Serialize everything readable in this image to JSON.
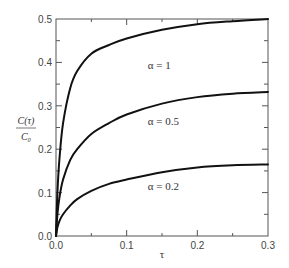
{
  "chart_data": {
    "type": "line",
    "title": "",
    "xlabel": "τ",
    "ylabel_numerator": "C(τ)",
    "ylabel_denominator": "C₀",
    "xlim": [
      0,
      0.3
    ],
    "ylim": [
      0,
      0.5
    ],
    "grid": false,
    "legend": "none",
    "x_ticks": [
      0.0,
      0.1,
      0.2,
      0.3
    ],
    "x_tick_labels": [
      "0.0",
      "0.1",
      "0.2",
      "0.3"
    ],
    "x_minor_ticks": [
      0.05,
      0.15,
      0.25
    ],
    "y_ticks": [
      0.0,
      0.1,
      0.2,
      0.3,
      0.4,
      0.5
    ],
    "y_tick_labels": [
      "0.0",
      "0.1",
      "0.2",
      "0.3",
      "0.4",
      "0.5"
    ],
    "y_minor_ticks": [
      0.05,
      0.15,
      0.25,
      0.35,
      0.45
    ],
    "series": [
      {
        "name": "α = 1",
        "annotation": {
          "text": "α = 1",
          "x": 0.13,
          "y": 0.385
        },
        "x": [
          0,
          0.002,
          0.005,
          0.01,
          0.02,
          0.03,
          0.05,
          0.075,
          0.1,
          0.15,
          0.2,
          0.25,
          0.3
        ],
        "y": [
          0,
          0.1,
          0.18,
          0.26,
          0.34,
          0.38,
          0.42,
          0.44,
          0.455,
          0.475,
          0.488,
          0.495,
          0.5
        ]
      },
      {
        "name": "α = 0.5",
        "annotation": {
          "text": "α = 0.5",
          "x": 0.13,
          "y": 0.255
        },
        "x": [
          0,
          0.002,
          0.005,
          0.01,
          0.02,
          0.03,
          0.05,
          0.075,
          0.1,
          0.15,
          0.2,
          0.25,
          0.3
        ],
        "y": [
          0,
          0.05,
          0.09,
          0.13,
          0.175,
          0.2,
          0.235,
          0.26,
          0.28,
          0.305,
          0.32,
          0.328,
          0.332
        ]
      },
      {
        "name": "α = 0.2",
        "annotation": {
          "text": "α = 0.2",
          "x": 0.13,
          "y": 0.105
        },
        "x": [
          0,
          0.002,
          0.005,
          0.01,
          0.02,
          0.03,
          0.05,
          0.075,
          0.1,
          0.15,
          0.2,
          0.25,
          0.3
        ],
        "y": [
          0,
          0.02,
          0.035,
          0.05,
          0.07,
          0.085,
          0.104,
          0.12,
          0.13,
          0.147,
          0.158,
          0.163,
          0.165
        ]
      }
    ]
  }
}
